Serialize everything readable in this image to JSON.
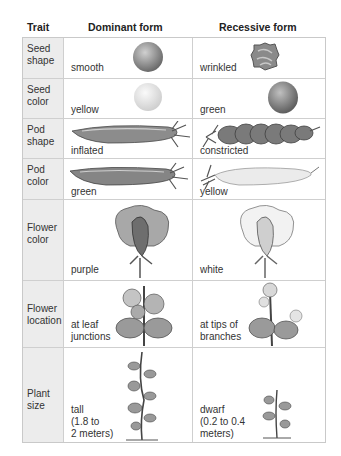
{
  "header": {
    "trait": "Trait",
    "dominant": "Dominant form",
    "recessive": "Recessive form"
  },
  "rows": [
    {
      "trait": "Seed\nshape",
      "dominant": "smooth",
      "recessive": "wrinkled",
      "dominant_icon": "smooth-pea-seed",
      "recessive_icon": "wrinkled-pea-seed"
    },
    {
      "trait": "Seed\ncolor",
      "dominant": "yellow",
      "recessive": "green",
      "dominant_icon": "yellow-pea-seed",
      "recessive_icon": "green-pea-seed"
    },
    {
      "trait": "Pod\nshape",
      "dominant": "inflated",
      "recessive": "constricted",
      "dominant_icon": "inflated-pod",
      "recessive_icon": "constricted-pod"
    },
    {
      "trait": "Pod\ncolor",
      "dominant": "green",
      "recessive": "yellow",
      "dominant_icon": "green-pod",
      "recessive_icon": "yellow-pod"
    },
    {
      "trait": "Flower\ncolor",
      "dominant": "purple",
      "recessive": "white",
      "dominant_icon": "purple-flower",
      "recessive_icon": "white-flower"
    },
    {
      "trait": "Flower\nlocation",
      "dominant": "at leaf\njunctions",
      "recessive": "at tips of\nbranches",
      "dominant_icon": "axial-flowers-plant",
      "recessive_icon": "terminal-flowers-plant"
    },
    {
      "trait": "Plant\nsize",
      "dominant": "tall\n(1.8 to\n2 meters)",
      "recessive": "dwarf\n(0.2 to 0.4\nmeters)",
      "dominant_icon": "tall-pea-plant",
      "recessive_icon": "dwarf-pea-plant"
    }
  ],
  "colors": {
    "trait_column_bg": "#ececec",
    "grid": "#cfcfcf"
  }
}
